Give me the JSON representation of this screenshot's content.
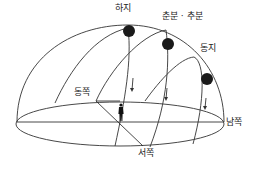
{
  "labels": {
    "summer_solstice": "하지",
    "equinox": "춘분 · 추분",
    "winter_solstice": "동지",
    "east": "동쪽",
    "south": "남쪽",
    "west": "서쪽"
  },
  "colors": {
    "line": "#333333",
    "sun": "#1a1a1a",
    "background": "#ffffff"
  },
  "icons": {
    "sun": "filled-circle",
    "observer": "person-silhouette"
  }
}
